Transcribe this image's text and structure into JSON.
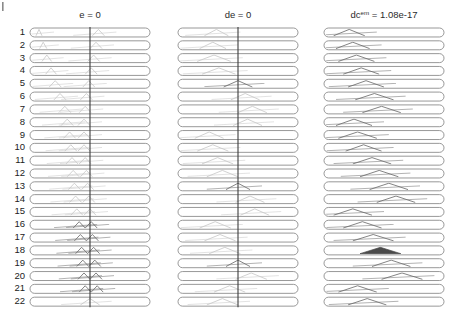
{
  "figure": {
    "width": 458,
    "height": 318,
    "background": "#ffffff",
    "corner_mark": "|",
    "row_label_axis_title": "",
    "n_rows": 22,
    "row_labels": [
      "1",
      "2",
      "3",
      "4",
      "5",
      "6",
      "7",
      "8",
      "9",
      "10",
      "11",
      "12",
      "13",
      "14",
      "15",
      "16",
      "17",
      "18",
      "19",
      "20",
      "21",
      "22"
    ],
    "colors": {
      "capsule_stroke": "#7d7d7d",
      "capsule_fill": "#ffffff",
      "center_line": "#3c3c3c",
      "trace_light": "#c9c9c9",
      "trace_mid": "#a8a8a8",
      "trace_dark": "#6e6e6e",
      "filled_triangle": "#4a4a4a",
      "text": "#222222"
    }
  },
  "panels": [
    {
      "id": "panel-e",
      "title": "e = 0",
      "title_label_plain": "e = 0",
      "has_center_line": true,
      "x": 30,
      "width": 120,
      "description": "oblique traces converging into a chevron stack at the centre line in lower rows"
    },
    {
      "id": "panel-de",
      "title": "de = 0",
      "title_label_plain": "de = 0",
      "has_center_line": true,
      "x": 178,
      "width": 120,
      "description": "crossing traces with dark arrow chevrons at rows 5, 13 and 19"
    },
    {
      "id": "panel-dcem",
      "title_prefix": "dc",
      "title_superscript": "em",
      "title_suffix": " = 1.08e-17",
      "title": "dc^em = 1.08e-17",
      "has_center_line": false,
      "x": 324,
      "width": 120,
      "description": "descending diagonal traces forming peaks, one solid filled triangle near row 18"
    }
  ],
  "chart_data": {
    "type": "line",
    "title": "",
    "subtitle": "",
    "xlabel": "",
    "ylabel": "",
    "grid": false,
    "legend": null,
    "layout": {
      "panels": 3,
      "rows_per_panel": 22,
      "row_track_shape": "rounded-capsule",
      "shared_y_tick_labels": [
        "1",
        "2",
        "3",
        "4",
        "5",
        "6",
        "7",
        "8",
        "9",
        "10",
        "11",
        "12",
        "13",
        "14",
        "15",
        "16",
        "17",
        "18",
        "19",
        "20",
        "21",
        "22"
      ]
    },
    "panel_titles": [
      "e = 0",
      "de = 0",
      "dc^em = 1.08e-17"
    ],
    "annotations": [
      {
        "panel": "dc^em = 1.08e-17",
        "text": "1.08e-17",
        "kind": "value"
      },
      {
        "panel": "e = 0",
        "text": "0",
        "kind": "value"
      },
      {
        "panel": "de = 0",
        "text": "0",
        "kind": "value"
      }
    ],
    "series": [
      {
        "name": "e = 0",
        "panel": 0,
        "rows": [
          {
            "row": 1,
            "segments": [
              [
                0.05,
                0.1
              ],
              [
                0.52,
                0.62
              ]
            ],
            "shade": "light"
          },
          {
            "row": 2,
            "segments": [
              [
                0.08,
                0.14
              ],
              [
                0.5,
                0.6
              ]
            ],
            "shade": "light"
          },
          {
            "row": 3,
            "segments": [
              [
                0.1,
                0.18
              ],
              [
                0.48,
                0.58
              ]
            ],
            "shade": "light"
          },
          {
            "row": 4,
            "segments": [
              [
                0.13,
                0.22
              ],
              [
                0.46,
                0.56
              ]
            ],
            "shade": "light"
          },
          {
            "row": 5,
            "segments": [
              [
                0.16,
                0.26
              ],
              [
                0.44,
                0.54
              ]
            ],
            "shade": "light"
          },
          {
            "row": 6,
            "segments": [
              [
                0.2,
                0.3
              ],
              [
                0.42,
                0.52
              ]
            ],
            "shade": "light"
          },
          {
            "row": 7,
            "segments": [
              [
                0.24,
                0.34
              ],
              [
                0.41,
                0.51
              ]
            ],
            "shade": "light"
          },
          {
            "row": 8,
            "segments": [
              [
                0.26,
                0.36
              ],
              [
                0.4,
                0.5
              ]
            ],
            "shade": "light"
          },
          {
            "row": 9,
            "segments": [
              [
                0.28,
                0.38
              ],
              [
                0.4,
                0.5
              ]
            ],
            "shade": "light"
          },
          {
            "row": 10,
            "segments": [
              [
                0.29,
                0.39
              ],
              [
                0.4,
                0.5
              ]
            ],
            "shade": "light"
          },
          {
            "row": 11,
            "segments": [
              [
                0.3,
                0.4
              ],
              [
                0.41,
                0.51
              ]
            ],
            "shade": "light"
          },
          {
            "row": 12,
            "segments": [
              [
                0.31,
                0.41
              ],
              [
                0.42,
                0.52
              ]
            ],
            "shade": "light"
          },
          {
            "row": 13,
            "segments": [
              [
                0.32,
                0.42
              ],
              [
                0.43,
                0.53
              ]
            ],
            "shade": "light"
          },
          {
            "row": 14,
            "segments": [
              [
                0.33,
                0.43
              ],
              [
                0.44,
                0.54
              ]
            ],
            "shade": "light"
          },
          {
            "row": 15,
            "segments": [
              [
                0.34,
                0.44
              ],
              [
                0.45,
                0.55
              ]
            ],
            "shade": "light"
          },
          {
            "row": 16,
            "segments": [
              [
                0.36,
                0.46
              ],
              [
                0.46,
                0.56
              ]
            ],
            "shade": "dark"
          },
          {
            "row": 17,
            "segments": [
              [
                0.37,
                0.47
              ],
              [
                0.47,
                0.57
              ]
            ],
            "shade": "dark"
          },
          {
            "row": 18,
            "segments": [
              [
                0.38,
                0.48
              ],
              [
                0.48,
                0.58
              ]
            ],
            "shade": "dark"
          },
          {
            "row": 19,
            "segments": [
              [
                0.39,
                0.49
              ],
              [
                0.49,
                0.59
              ]
            ],
            "shade": "dark"
          },
          {
            "row": 20,
            "segments": [
              [
                0.4,
                0.5
              ],
              [
                0.5,
                0.6
              ]
            ],
            "shade": "dark"
          },
          {
            "row": 21,
            "segments": [
              [
                0.41,
                0.51
              ],
              [
                0.51,
                0.61
              ]
            ],
            "shade": "dark"
          },
          {
            "row": 22,
            "segments": [
              [
                0.42,
                0.58
              ]
            ],
            "shade": "light"
          }
        ]
      },
      {
        "name": "de = 0",
        "panel": 1,
        "rows": [
          {
            "row": 1,
            "segments": [
              [
                0.22,
                0.42
              ]
            ],
            "shade": "light"
          },
          {
            "row": 2,
            "segments": [
              [
                0.18,
                0.4
              ]
            ],
            "shade": "light"
          },
          {
            "row": 3,
            "segments": [
              [
                0.16,
                0.44
              ]
            ],
            "shade": "light"
          },
          {
            "row": 4,
            "segments": [
              [
                0.2,
                0.48
              ]
            ],
            "shade": "light"
          },
          {
            "row": 5,
            "segments": [
              [
                0.38,
                0.62
              ]
            ],
            "shade": "dark"
          },
          {
            "row": 6,
            "segments": [
              [
                0.44,
                0.68
              ]
            ],
            "shade": "light"
          },
          {
            "row": 7,
            "segments": [
              [
                0.5,
                0.74
              ]
            ],
            "shade": "light"
          },
          {
            "row": 8,
            "segments": [
              [
                0.46,
                0.7
              ]
            ],
            "shade": "light"
          },
          {
            "row": 9,
            "segments": [
              [
                0.14,
                0.38
              ]
            ],
            "shade": "light"
          },
          {
            "row": 10,
            "segments": [
              [
                0.16,
                0.42
              ]
            ],
            "shade": "light"
          },
          {
            "row": 11,
            "segments": [
              [
                0.2,
                0.46
              ]
            ],
            "shade": "light"
          },
          {
            "row": 12,
            "segments": [
              [
                0.24,
                0.5
              ]
            ],
            "shade": "light"
          },
          {
            "row": 13,
            "segments": [
              [
                0.4,
                0.6
              ]
            ],
            "shade": "dark"
          },
          {
            "row": 14,
            "segments": [
              [
                0.48,
                0.72
              ]
            ],
            "shade": "light"
          },
          {
            "row": 15,
            "segments": [
              [
                0.52,
                0.76
              ]
            ],
            "shade": "light"
          },
          {
            "row": 16,
            "segments": [
              [
                0.18,
                0.44
              ]
            ],
            "shade": "light"
          },
          {
            "row": 17,
            "segments": [
              [
                0.22,
                0.48
              ]
            ],
            "shade": "light"
          },
          {
            "row": 18,
            "segments": [
              [
                0.26,
                0.52
              ]
            ],
            "shade": "light"
          },
          {
            "row": 19,
            "segments": [
              [
                0.4,
                0.6
              ]
            ],
            "shade": "dark"
          },
          {
            "row": 20,
            "segments": [
              [
                0.48,
                0.74
              ]
            ],
            "shade": "light"
          },
          {
            "row": 21,
            "segments": [
              [
                0.3,
                0.56
              ]
            ],
            "shade": "light"
          },
          {
            "row": 22,
            "segments": [
              [
                0.24,
                0.5
              ]
            ],
            "shade": "light"
          }
        ]
      },
      {
        "name": "dc^em = 1.08e-17",
        "panel": 2,
        "rows": [
          {
            "row": 1,
            "segments": [
              [
                0.08,
                0.34
              ]
            ],
            "shade": "dark"
          },
          {
            "row": 2,
            "segments": [
              [
                0.1,
                0.38
              ]
            ],
            "shade": "dark"
          },
          {
            "row": 3,
            "segments": [
              [
                0.12,
                0.42
              ]
            ],
            "shade": "dark"
          },
          {
            "row": 4,
            "segments": [
              [
                0.16,
                0.46
              ]
            ],
            "shade": "dark"
          },
          {
            "row": 5,
            "segments": [
              [
                0.2,
                0.5
              ]
            ],
            "shade": "dark"
          },
          {
            "row": 6,
            "segments": [
              [
                0.26,
                0.58
              ]
            ],
            "shade": "dark"
          },
          {
            "row": 7,
            "segments": [
              [
                0.32,
                0.64
              ]
            ],
            "shade": "dark"
          },
          {
            "row": 8,
            "segments": [
              [
                0.1,
                0.4
              ]
            ],
            "shade": "dark"
          },
          {
            "row": 9,
            "segments": [
              [
                0.12,
                0.44
              ]
            ],
            "shade": "dark"
          },
          {
            "row": 10,
            "segments": [
              [
                0.18,
                0.48
              ]
            ],
            "shade": "dark"
          },
          {
            "row": 11,
            "segments": [
              [
                0.24,
                0.56
              ]
            ],
            "shade": "dark"
          },
          {
            "row": 12,
            "segments": [
              [
                0.3,
                0.62
              ]
            ],
            "shade": "dark"
          },
          {
            "row": 13,
            "segments": [
              [
                0.38,
                0.7
              ]
            ],
            "shade": "dark"
          },
          {
            "row": 14,
            "segments": [
              [
                0.44,
                0.76
              ]
            ],
            "shade": "dark"
          },
          {
            "row": 15,
            "segments": [
              [
                0.08,
                0.4
              ]
            ],
            "shade": "dark"
          },
          {
            "row": 16,
            "segments": [
              [
                0.16,
                0.48
              ]
            ],
            "shade": "dark"
          },
          {
            "row": 17,
            "segments": [
              [
                0.24,
                0.58
              ]
            ],
            "shade": "dark"
          },
          {
            "row": 18,
            "segments": [
              [
                0.3,
                0.64
              ]
            ],
            "shade": "filled"
          },
          {
            "row": 19,
            "segments": [
              [
                0.4,
                0.72
              ]
            ],
            "shade": "dark"
          },
          {
            "row": 20,
            "segments": [
              [
                0.48,
                0.82
              ]
            ],
            "shade": "dark"
          },
          {
            "row": 21,
            "segments": [
              [
                0.12,
                0.44
              ]
            ],
            "shade": "dark"
          },
          {
            "row": 22,
            "segments": [
              [
                0.2,
                0.52
              ]
            ],
            "shade": "dark"
          }
        ]
      }
    ]
  }
}
